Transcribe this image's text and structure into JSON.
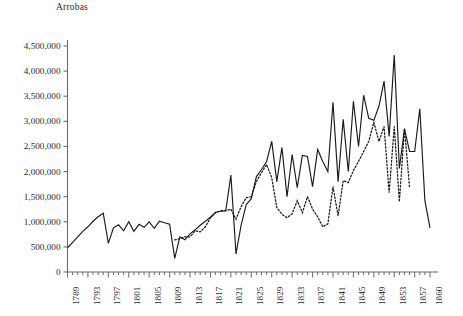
{
  "chart_data": {
    "type": "line",
    "title": "",
    "subtitle": "",
    "xlabel": "",
    "ylabel": "Arrobas",
    "unit_label": "Arrobas",
    "grid": false,
    "legend_position": "none",
    "xlim": [
      1789,
      1860
    ],
    "ylim": [
      0,
      4500000
    ],
    "ytick_values": [
      0,
      500000,
      1000000,
      1500000,
      2000000,
      2500000,
      3000000,
      3500000,
      4000000,
      4500000
    ],
    "ytick_labels": [
      "0",
      "500,000",
      "1,000,000",
      "1,500,000",
      "2,000,000",
      "2,500,000",
      "3,000,000",
      "3,500,000",
      "4,000,000",
      "4,500,000"
    ],
    "xtick_values": [
      1789,
      1793,
      1797,
      1801,
      1805,
      1809,
      1813,
      1817,
      1821,
      1825,
      1829,
      1833,
      1837,
      1841,
      1845,
      1849,
      1853,
      1857,
      1860
    ],
    "xtick_labels": [
      "1789",
      "1793",
      "1797",
      "1801",
      "1805",
      "1809",
      "1813",
      "1817",
      "1821",
      "1825",
      "1829",
      "1833",
      "1837",
      "1841",
      "1845",
      "1849",
      "1853",
      "1857",
      "1860"
    ],
    "minor_ticks_every": 1,
    "series": [
      {
        "name": "series-solid",
        "style": "solid",
        "color": "#1a1a1a",
        "x": [
          1789,
          1790,
          1791,
          1792,
          1793,
          1794,
          1795,
          1796,
          1797,
          1798,
          1799,
          1800,
          1801,
          1802,
          1803,
          1804,
          1805,
          1806,
          1807,
          1808,
          1809,
          1810,
          1811,
          1812,
          1813,
          1814,
          1815,
          1816,
          1817,
          1818,
          1819,
          1820,
          1821,
          1822,
          1823,
          1824,
          1825,
          1826,
          1827,
          1828,
          1829,
          1830,
          1831,
          1832,
          1833,
          1834,
          1835,
          1836,
          1837,
          1838,
          1839,
          1840,
          1841,
          1842,
          1843,
          1844,
          1845,
          1846,
          1847,
          1848,
          1849,
          1850,
          1851,
          1852,
          1853,
          1854,
          1855,
          1856,
          1857,
          1858,
          1859,
          1860
        ],
        "values": [
          480000,
          590000,
          700000,
          810000,
          900000,
          1010000,
          1100000,
          1170000,
          570000,
          880000,
          940000,
          820000,
          1000000,
          810000,
          950000,
          890000,
          1000000,
          870000,
          1010000,
          980000,
          950000,
          270000,
          700000,
          640000,
          760000,
          840000,
          930000,
          1010000,
          1090000,
          1190000,
          1210000,
          1220000,
          1930000,
          360000,
          930000,
          1340000,
          1460000,
          1900000,
          2040000,
          2200000,
          2600000,
          1800000,
          2480000,
          1500000,
          2340000,
          1680000,
          2320000,
          2300000,
          1700000,
          2440000,
          2200000,
          2000000,
          3380000,
          1800000,
          3040000,
          2000000,
          3400000,
          2500000,
          3520000,
          3060000,
          3020000,
          3300000,
          3800000,
          2700000,
          4320000,
          2060000,
          2850000,
          2400000,
          2400000,
          3250000,
          1420000,
          880000
        ]
      },
      {
        "name": "series-dotted",
        "style": "dotted",
        "color": "#1a1a1a",
        "x": [
          1810,
          1811,
          1812,
          1813,
          1814,
          1815,
          1816,
          1817,
          1818,
          1819,
          1820,
          1821,
          1822,
          1823,
          1824,
          1825,
          1826,
          1827,
          1828,
          1829,
          1830,
          1831,
          1832,
          1833,
          1834,
          1835,
          1836,
          1837,
          1838,
          1839,
          1840,
          1841,
          1842,
          1843,
          1844,
          1845,
          1846,
          1847,
          1848,
          1849,
          1850,
          1851,
          1852,
          1853,
          1854,
          1855,
          1856
        ],
        "values": [
          640000,
          660000,
          700000,
          700000,
          820000,
          800000,
          900000,
          1080000,
          1180000,
          1220000,
          1220000,
          1250000,
          1050000,
          1300000,
          1480000,
          1500000,
          1800000,
          1980000,
          2140000,
          1880000,
          1280000,
          1150000,
          1080000,
          1160000,
          1420000,
          1180000,
          1500000,
          1250000,
          1100000,
          900000,
          960000,
          1700000,
          1120000,
          1820000,
          1780000,
          2020000,
          2200000,
          2400000,
          2600000,
          2980000,
          2600000,
          2900000,
          1580000,
          2900000,
          1400000,
          2860000,
          1680000
        ]
      }
    ]
  }
}
